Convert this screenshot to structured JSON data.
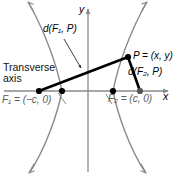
{
  "figure": {
    "background_color": "#ffffff",
    "width": 175,
    "height": 175
  },
  "axes": {
    "x_label": "x",
    "y_label": "y",
    "x_axis_color": "#8a8a8a",
    "y_axis_color": "#8a8a8a",
    "origin_px": {
      "x": 88,
      "y": 91
    }
  },
  "labels": {
    "transverse_axis": "Transverse\naxis",
    "transverse_axis_line1": "Transverse",
    "transverse_axis_line2": "axis",
    "d_f1_p": "d(F₁, P)",
    "d_f2_p": "d(F₂, P)",
    "point_p": "P = (x, y)",
    "focus_1": "F₁ = (−c, 0)",
    "focus_2": "F₂ = (c, 0)"
  },
  "points": [
    {
      "name": "focus-1",
      "label": "F₁ = (−c, 0)",
      "value": "(-c, 0)",
      "px": {
        "x": 39,
        "y": 91
      },
      "color": "#000000"
    },
    {
      "name": "vertex-left",
      "label": "",
      "value": "(-a, 0)",
      "px": {
        "x": 62,
        "y": 91
      },
      "color": "#000000"
    },
    {
      "name": "vertex-right",
      "label": "",
      "value": "(a, 0)",
      "px": {
        "x": 113,
        "y": 91
      },
      "color": "#000000"
    },
    {
      "name": "focus-2",
      "label": "F₂ = (c, 0)",
      "value": "(c, 0)",
      "px": {
        "x": 140,
        "y": 91
      },
      "color": "#000000"
    },
    {
      "name": "point-p",
      "label": "P = (x, y)",
      "value": "(x, y)",
      "px": {
        "x": 128,
        "y": 57
      },
      "color": "#000000"
    }
  ],
  "segments": [
    {
      "name": "segment-f1-p",
      "from": "focus-1",
      "to": "point-p",
      "label": "d(F₁, P)",
      "color": "#000000",
      "width": 2.6
    },
    {
      "name": "segment-f2-p",
      "from": "point-p",
      "to": "focus-2",
      "label": "d(F₂, P)",
      "color": "#000000",
      "width": 2.6
    }
  ],
  "curves": {
    "color": "#8a8a8a",
    "width": 1.4,
    "left_branch_vertex_px": {
      "x": 62,
      "y": 91
    },
    "right_branch_vertex_px": {
      "x": 113,
      "y": 91
    },
    "arrowheads": 4
  },
  "colors": {
    "curve": "#8a8a8a",
    "axis": "#8a8a8a",
    "segment": "#000000",
    "label_muted": "#5b5b5b",
    "label": "#000000",
    "point": "#000000"
  }
}
